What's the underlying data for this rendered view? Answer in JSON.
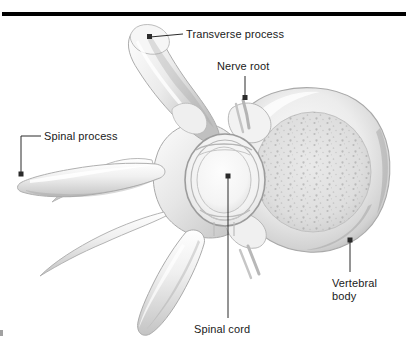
{
  "figure": {
    "top_rule": {
      "name": "horizontal-rule",
      "color": "#000000"
    },
    "colors": {
      "background": "#ffffff",
      "bone_light": "#f7f7f7",
      "bone_mid": "#dcdcdc",
      "bone_shadow": "#b4b4b4",
      "bone_dark": "#8f8f8f",
      "outline": "#9a9a9a",
      "label_text": "#1a1a1a",
      "leader_line": "#2b2b2b"
    }
  },
  "labels": [
    {
      "id": "transverse-process",
      "text": "Transverse process",
      "lines": [
        "Transverse process"
      ],
      "leader": {
        "from_x": 150,
        "from_y": 37,
        "to_x": 183,
        "to_y": 34,
        "dot": true
      }
    },
    {
      "id": "nerve-root",
      "text": "Nerve root",
      "lines": [
        "Nerve root"
      ],
      "leader": {
        "from_x": 245,
        "from_y": 98,
        "to_x": 245,
        "to_y": 76,
        "dot": true
      }
    },
    {
      "id": "spinal-process",
      "text": "Spinal process",
      "lines": [
        "Spinal process"
      ],
      "leader": {
        "from_x": 21,
        "from_y": 174,
        "to_x": 41,
        "to_y": 136,
        "dot": true
      }
    },
    {
      "id": "spinal-cord",
      "text": "Spinal cord",
      "lines": [
        "Spinal cord"
      ],
      "leader": {
        "from_x": 228,
        "from_y": 176,
        "to_x": 228,
        "to_y": 318,
        "dot": true
      }
    },
    {
      "id": "vertebral-body",
      "text": "Vertebral body",
      "lines": [
        "Vertebral",
        "body"
      ],
      "leader": {
        "from_x": 350,
        "from_y": 240,
        "to_x": 350,
        "to_y": 272,
        "dot": true
      }
    }
  ],
  "structures": [
    {
      "id": "transverse-process",
      "name": "transverse process"
    },
    {
      "id": "spinous-process",
      "name": "spinous process"
    },
    {
      "id": "vertebral-body",
      "name": "vertebral body"
    },
    {
      "id": "vertebral-foramen",
      "name": "vertebral foramen / spinal canal"
    },
    {
      "id": "spinal-cord",
      "name": "spinal cord"
    },
    {
      "id": "nerve-root",
      "name": "nerve root"
    },
    {
      "id": "lamina",
      "name": "lamina"
    },
    {
      "id": "pedicle",
      "name": "pedicle"
    },
    {
      "id": "articular-process",
      "name": "superior articular process"
    }
  ]
}
